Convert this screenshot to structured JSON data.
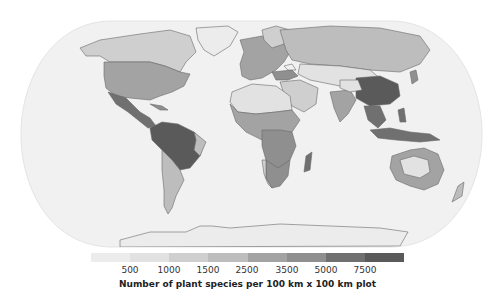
{
  "map": {
    "type": "choropleth",
    "projection": "elliptical-world (Robinson-like)",
    "ocean_color": "#f1f1f1",
    "coast_color": "#6a6a6a",
    "legend": {
      "title": "Number of plant species per 100 km x 100 km plot",
      "tick_labels": [
        "500",
        "1000",
        "1500",
        "2500",
        "3500",
        "5000",
        "7500"
      ],
      "classes": [
        {
          "range": "<500",
          "color": "#ececec"
        },
        {
          "range": "500-1000",
          "color": "#e2e2e2"
        },
        {
          "range": "1000-1500",
          "color": "#cfcfcf"
        },
        {
          "range": "1500-2500",
          "color": "#bdbdbd"
        },
        {
          "range": "2500-3500",
          "color": "#a3a3a3"
        },
        {
          "range": "3500-5000",
          "color": "#8f8f8f"
        },
        {
          "range": "5000-7500",
          "color": "#707070"
        },
        {
          "range": ">7500",
          "color": "#5a5a5a"
        }
      ]
    },
    "regions": [
      {
        "name": "Greenland",
        "class": 0
      },
      {
        "name": "Canada/Alaska",
        "class": 2
      },
      {
        "name": "United States",
        "class": 4
      },
      {
        "name": "Mexico/Central America",
        "class": 6
      },
      {
        "name": "Amazon/Brazil",
        "class": 7
      },
      {
        "name": "Southern South America",
        "class": 3
      },
      {
        "name": "Europe",
        "class": 4
      },
      {
        "name": "Sahara",
        "class": 1
      },
      {
        "name": "Sub-Saharan Africa",
        "class": 4
      },
      {
        "name": "Central Africa",
        "class": 5
      },
      {
        "name": "Southern Africa",
        "class": 5
      },
      {
        "name": "Madagascar",
        "class": 6
      },
      {
        "name": "Arabia",
        "class": 2
      },
      {
        "name": "Siberia/Russia",
        "class": 3
      },
      {
        "name": "Central Asia deserts",
        "class": 1
      },
      {
        "name": "South/East China",
        "class": 7
      },
      {
        "name": "India",
        "class": 4
      },
      {
        "name": "Southeast Asia/Indonesia",
        "class": 6
      },
      {
        "name": "Australia interior",
        "class": 1
      },
      {
        "name": "Australia coast",
        "class": 4
      },
      {
        "name": "Antarctica",
        "class": 0
      }
    ]
  }
}
